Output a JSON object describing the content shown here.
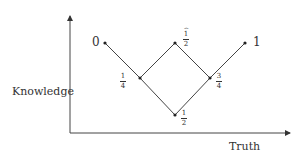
{
  "diagram": {
    "axes": {
      "x_label": "Truth",
      "y_label": "Knowledge"
    },
    "nodes": [
      {
        "id": "n0",
        "label": "0",
        "type": "integer",
        "x": 105,
        "y": 43
      },
      {
        "id": "n1_4",
        "label": "1/4",
        "numerator": "1",
        "denominator": "4",
        "type": "fraction",
        "x": 140,
        "y": 78
      },
      {
        "id": "n1_2_top",
        "label": "½̂",
        "numerator": "1",
        "denominator": "2",
        "hat": "⌢",
        "type": "fraction-hat",
        "x": 175,
        "y": 43
      },
      {
        "id": "n1_2_bottom",
        "label": "1/2",
        "numerator": "1",
        "denominator": "2",
        "type": "fraction",
        "x": 175,
        "y": 115
      },
      {
        "id": "n3_4",
        "label": "3/4",
        "numerator": "3",
        "denominator": "4",
        "type": "fraction",
        "x": 210,
        "y": 78
      },
      {
        "id": "n1",
        "label": "1",
        "type": "integer",
        "x": 245,
        "y": 43
      }
    ],
    "edges": [
      [
        "n0",
        "n1_4"
      ],
      [
        "n1_4",
        "n1_2_top"
      ],
      [
        "n1_4",
        "n1_2_bottom"
      ],
      [
        "n1_2_top",
        "n3_4"
      ],
      [
        "n1_2_bottom",
        "n3_4"
      ],
      [
        "n3_4",
        "n1"
      ]
    ],
    "colors": {
      "line": "#444444",
      "text": "#333333",
      "background": "#ffffff"
    }
  }
}
